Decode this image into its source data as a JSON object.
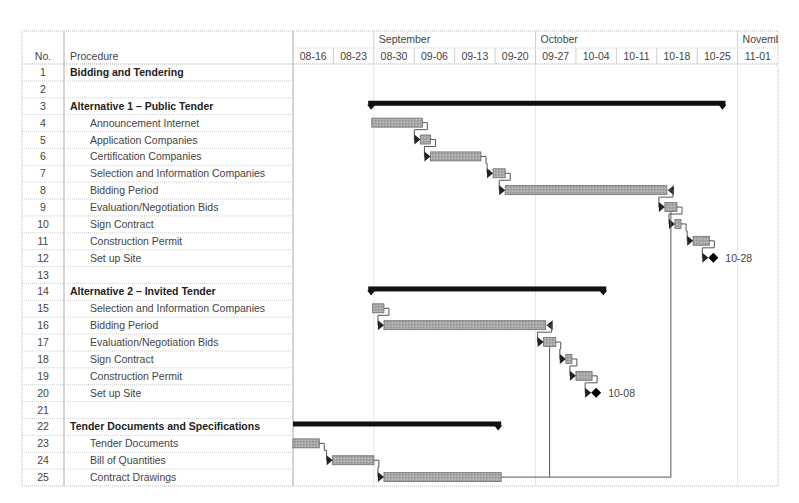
{
  "table": {
    "col_no_label": "No.",
    "col_procedure_label": "Procedure",
    "rows": [
      {
        "no": "1",
        "procedure": "Bidding and Tendering",
        "bold": true
      },
      {
        "no": "2",
        "procedure": "",
        "bold": false
      },
      {
        "no": "3",
        "procedure": "Alternative 1 – Public Tender",
        "bold": true
      },
      {
        "no": "4",
        "procedure": "Announcement Internet",
        "bold": false
      },
      {
        "no": "5",
        "procedure": "Application Companies",
        "bold": false
      },
      {
        "no": "6",
        "procedure": "Certification Companies",
        "bold": false
      },
      {
        "no": "7",
        "procedure": "Selection and Information Companies",
        "bold": false
      },
      {
        "no": "8",
        "procedure": "Bidding Period",
        "bold": false
      },
      {
        "no": "9",
        "procedure": "Evaluation/Negotiation Bids",
        "bold": false
      },
      {
        "no": "10",
        "procedure": "Sign Contract",
        "bold": false
      },
      {
        "no": "11",
        "procedure": "Construction Permit",
        "bold": false
      },
      {
        "no": "12",
        "procedure": "Set up Site",
        "bold": false
      },
      {
        "no": "13",
        "procedure": "",
        "bold": false
      },
      {
        "no": "14",
        "procedure": "Alternative 2 – Invited Tender",
        "bold": true
      },
      {
        "no": "15",
        "procedure": "Selection and Information Companies",
        "bold": false
      },
      {
        "no": "16",
        "procedure": "Bidding Period",
        "bold": false
      },
      {
        "no": "17",
        "procedure": "Evaluation/Negotiation Bids",
        "bold": false
      },
      {
        "no": "18",
        "procedure": "Sign Contract",
        "bold": false
      },
      {
        "no": "19",
        "procedure": "Construction Permit",
        "bold": false
      },
      {
        "no": "20",
        "procedure": "Set up Site",
        "bold": false
      },
      {
        "no": "21",
        "procedure": "",
        "bold": false
      },
      {
        "no": "22",
        "procedure": "Tender Documents and Specifications",
        "bold": true
      },
      {
        "no": "23",
        "procedure": "Tender Documents",
        "bold": false
      },
      {
        "no": "24",
        "procedure": "Bill of Quantities",
        "bold": false
      },
      {
        "no": "25",
        "procedure": "Contract Drawings",
        "bold": false
      }
    ]
  },
  "timeline": {
    "months": [
      {
        "label": "",
        "start_week": 0,
        "span": 2
      },
      {
        "label": "September",
        "start_week": 2,
        "span": 4
      },
      {
        "label": "October",
        "start_week": 6,
        "span": 5
      },
      {
        "label": "Novemb",
        "start_week": 11,
        "span": 1
      }
    ],
    "weeks": [
      "08-16",
      "08-23",
      "08-30",
      "09-06",
      "09-13",
      "09-20",
      "09-27",
      "10-04",
      "10-11",
      "10-18",
      "10-25",
      "11-01"
    ]
  },
  "chart_data": {
    "type": "gantt",
    "title": "",
    "x_axis": {
      "unit": "week",
      "ticks": [
        "08-16",
        "08-23",
        "08-30",
        "09-06",
        "09-13",
        "09-20",
        "09-27",
        "10-04",
        "10-11",
        "10-18",
        "10-25",
        "11-01"
      ],
      "months": [
        "September",
        "October",
        "Novemb"
      ]
    },
    "tasks": [
      {
        "row": 3,
        "name": "Alternative 1 – Public Tender",
        "type": "summary",
        "start_wk": 1.86,
        "end_wk": 10.7
      },
      {
        "row": 4,
        "name": "Announcement Internet",
        "type": "task",
        "start_wk": 1.95,
        "end_wk": 3.2
      },
      {
        "row": 5,
        "name": "Application Companies",
        "type": "task",
        "start_wk": 3.15,
        "end_wk": 3.4
      },
      {
        "row": 6,
        "name": "Certification Companies",
        "type": "task",
        "start_wk": 3.4,
        "end_wk": 4.65
      },
      {
        "row": 7,
        "name": "Selection and Information Companies",
        "type": "task",
        "start_wk": 4.95,
        "end_wk": 5.25
      },
      {
        "row": 8,
        "name": "Bidding Period",
        "type": "task",
        "start_wk": 5.25,
        "end_wk": 9.25
      },
      {
        "row": 9,
        "name": "Evaluation/Negotiation Bids",
        "type": "task",
        "start_wk": 9.2,
        "end_wk": 9.5
      },
      {
        "row": 10,
        "name": "Sign Contract",
        "type": "task",
        "start_wk": 9.45,
        "end_wk": 9.6
      },
      {
        "row": 11,
        "name": "Construction Permit",
        "type": "task",
        "start_wk": 9.9,
        "end_wk": 10.3
      },
      {
        "row": 12,
        "name": "Set up Site",
        "type": "milestone",
        "at_wk": 10.4,
        "label": "10-28"
      },
      {
        "row": 14,
        "name": "Alternative 2 – Invited Tender",
        "type": "summary",
        "start_wk": 1.86,
        "end_wk": 7.75
      },
      {
        "row": 15,
        "name": "Selection and Information Companies",
        "type": "task",
        "start_wk": 1.97,
        "end_wk": 2.25
      },
      {
        "row": 16,
        "name": "Bidding Period",
        "type": "task",
        "start_wk": 2.25,
        "end_wk": 6.25
      },
      {
        "row": 17,
        "name": "Evaluation/Negotiation Bids",
        "type": "task",
        "start_wk": 6.2,
        "end_wk": 6.5
      },
      {
        "row": 18,
        "name": "Sign Contract",
        "type": "task",
        "start_wk": 6.75,
        "end_wk": 6.9
      },
      {
        "row": 19,
        "name": "Construction Permit",
        "type": "task",
        "start_wk": 7.0,
        "end_wk": 7.4
      },
      {
        "row": 20,
        "name": "Set up Site",
        "type": "milestone",
        "at_wk": 7.5,
        "label": "10-08"
      },
      {
        "row": 22,
        "name": "Tender Documents and Specifications",
        "type": "summary",
        "start_wk": 0,
        "end_wk": 5.15
      },
      {
        "row": 23,
        "name": "Tender Documents",
        "type": "task",
        "start_wk": 0,
        "end_wk": 0.65
      },
      {
        "row": 24,
        "name": "Bill of Quantities",
        "type": "task",
        "start_wk": 0.98,
        "end_wk": 2.0
      },
      {
        "row": 25,
        "name": "Contract Drawings",
        "type": "task",
        "start_wk": 2.25,
        "end_wk": 5.15
      }
    ],
    "milestone_labels": [
      "10-28",
      "10-08"
    ],
    "grid": true,
    "colors": {
      "bar_fill": "#a8a8a8",
      "bar_border": "#6e6e6e",
      "summary": "#111111",
      "link": "#555555",
      "grid": "#cfcfcf"
    }
  }
}
